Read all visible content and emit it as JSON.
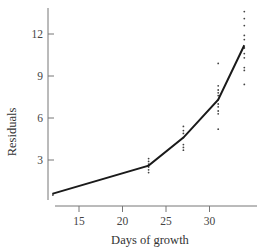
{
  "chart_data": {
    "type": "line",
    "title": "",
    "xlabel": "Days of growth",
    "ylabel": "Residuals",
    "xlim": [
      11.5,
      35
    ],
    "ylim": [
      -0.4,
      14
    ],
    "x_ticks": [
      15,
      20,
      25,
      30
    ],
    "y_ticks": [
      3,
      6,
      9,
      12
    ],
    "grid": false,
    "legend": null,
    "series": [
      {
        "name": "fitted curve",
        "kind": "line",
        "x": [
          12,
          23,
          27,
          31,
          34
        ],
        "y": [
          0.6,
          2.6,
          4.6,
          7.3,
          11.2
        ]
      },
      {
        "name": "residual points",
        "kind": "scatter",
        "points": [
          [
            12,
            0.6
          ],
          [
            12,
            0.5
          ],
          [
            23,
            2.1
          ],
          [
            23,
            2.3
          ],
          [
            23,
            2.5
          ],
          [
            23,
            2.7
          ],
          [
            23,
            2.9
          ],
          [
            23,
            3.1
          ],
          [
            27,
            3.7
          ],
          [
            27,
            3.9
          ],
          [
            27,
            4.1
          ],
          [
            27,
            4.6
          ],
          [
            27,
            4.9
          ],
          [
            27,
            5.1
          ],
          [
            27,
            5.4
          ],
          [
            31,
            5.2
          ],
          [
            31,
            6.3
          ],
          [
            31,
            6.5
          ],
          [
            31,
            6.8
          ],
          [
            31,
            7.0
          ],
          [
            31,
            7.3
          ],
          [
            31,
            7.6
          ],
          [
            31,
            7.8
          ],
          [
            31,
            8.0
          ],
          [
            31,
            8.3
          ],
          [
            31,
            9.9
          ],
          [
            34,
            8.4
          ],
          [
            34,
            9.4
          ],
          [
            34,
            9.6
          ],
          [
            34,
            10.3
          ],
          [
            34,
            10.6
          ],
          [
            34,
            11.0
          ],
          [
            34,
            11.6
          ],
          [
            34,
            11.9
          ],
          [
            34,
            12.6
          ],
          [
            34,
            13.1
          ],
          [
            34,
            13.6
          ]
        ]
      }
    ]
  }
}
